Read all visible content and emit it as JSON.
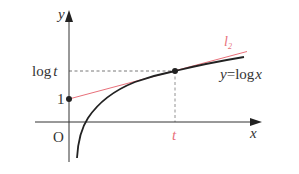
{
  "diagram": {
    "axes": {
      "x_label": "x",
      "y_label": "y",
      "origin_label": "O"
    },
    "y_ticks": {
      "one": "1",
      "log_t_prefix": "log",
      "log_t_var": "t"
    },
    "x_ticks": {
      "t": "t"
    },
    "curve": {
      "label_y": "y",
      "label_eq": "=",
      "label_log": "log",
      "label_x": "x",
      "color": "#222222"
    },
    "tangent": {
      "label_l": "l",
      "label_sub": "2",
      "color": "#e8707a"
    },
    "points": [
      {
        "name": "y-intercept",
        "coords": "(0, 1)"
      },
      {
        "name": "tangent-point",
        "coords": "(t, log t)"
      }
    ]
  }
}
